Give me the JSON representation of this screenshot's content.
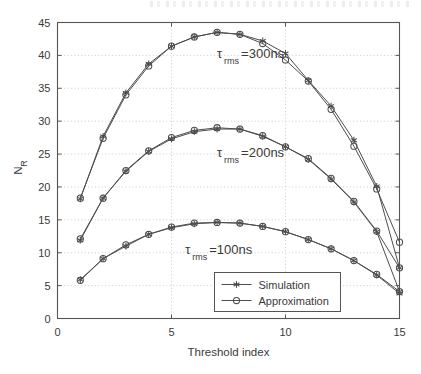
{
  "figure": {
    "background_color": "#ffffff",
    "axes_color": "#555555",
    "grid_color": "#bfbfbf",
    "series_color": "#4d4d4d"
  },
  "axes": {
    "xlabel": "Threshold index",
    "ylabel_main": "N",
    "ylabel_sub": "R",
    "x_ticks": [
      "0",
      "5",
      "10",
      "15"
    ],
    "y_ticks": [
      "0",
      "5",
      "10",
      "15",
      "20",
      "25",
      "30",
      "35",
      "40",
      "45"
    ]
  },
  "legend": {
    "items": [
      {
        "label": "Simulation",
        "marker": "star-marker"
      },
      {
        "label": "Approximation",
        "marker": "circle-marker"
      }
    ]
  },
  "annotations": [
    {
      "name": "tau-300ns",
      "symbol": "τ",
      "subscript": "rms",
      "text": "=300ns",
      "x": 7.0,
      "y": 39.6
    },
    {
      "name": "tau-200ns",
      "symbol": "τ",
      "subscript": "rms",
      "text": "=200ns",
      "x": 7.0,
      "y": 24.6
    },
    {
      "name": "tau-100ns",
      "symbol": "τ",
      "subscript": "rms",
      "text": "=100ns",
      "x": 5.6,
      "y": 9.8
    }
  ],
  "chart_data": {
    "type": "line",
    "title": "",
    "xlabel": "Threshold index",
    "ylabel": "N_R",
    "xlim": [
      0,
      15
    ],
    "ylim": [
      0,
      45
    ],
    "xticks": [
      0,
      5,
      10,
      15
    ],
    "yticks": [
      0,
      5,
      10,
      15,
      20,
      25,
      30,
      35,
      40,
      45
    ],
    "grid": true,
    "legend_position": "lower right",
    "x": [
      1,
      2,
      3,
      4,
      5,
      6,
      7,
      8,
      9,
      10,
      11,
      12,
      13,
      14,
      15
    ],
    "groups": [
      {
        "name": "tau_rms=300ns",
        "series": [
          {
            "name": "Simulation",
            "marker": "star",
            "values": [
              18.2,
              27.7,
              34.3,
              38.7,
              41.4,
              42.8,
              43.5,
              43.2,
              42.2,
              40.3,
              36.2,
              32.3,
              27.1,
              20.1,
              7.7
            ]
          },
          {
            "name": "Approximation",
            "marker": "circle",
            "values": [
              18.3,
              27.4,
              34.0,
              38.4,
              41.4,
              42.8,
              43.5,
              43.2,
              41.8,
              39.3,
              36.1,
              31.8,
              26.2,
              19.7,
              11.6
            ]
          }
        ]
      },
      {
        "name": "tau_rms=200ns",
        "series": [
          {
            "name": "Simulation",
            "marker": "star",
            "values": [
              11.9,
              18.3,
              22.4,
              25.4,
              27.3,
              28.4,
              28.8,
              28.8,
              27.7,
              26.1,
              24.2,
              21.2,
              17.7,
              13.2,
              4.1
            ]
          },
          {
            "name": "Approximation",
            "marker": "circle",
            "values": [
              12.1,
              18.3,
              22.5,
              25.5,
              27.5,
              28.6,
              29.0,
              28.8,
              27.8,
              26.1,
              24.3,
              21.3,
              17.8,
              13.3,
              7.7
            ]
          }
        ]
      },
      {
        "name": "tau_rms=100ns",
        "series": [
          {
            "name": "Simulation",
            "marker": "star",
            "values": [
              5.9,
              9.1,
              11.0,
              12.8,
              13.8,
              14.4,
              14.6,
              14.5,
              14.0,
              13.2,
              12.0,
              10.6,
              8.8,
              6.6,
              3.8
            ]
          },
          {
            "name": "Approximation",
            "marker": "circle",
            "values": [
              5.8,
              9.1,
              11.2,
              12.8,
              13.9,
              14.5,
              14.6,
              14.5,
              14.0,
              13.2,
              12.0,
              10.6,
              8.8,
              6.7,
              4.1
            ]
          }
        ]
      }
    ]
  }
}
